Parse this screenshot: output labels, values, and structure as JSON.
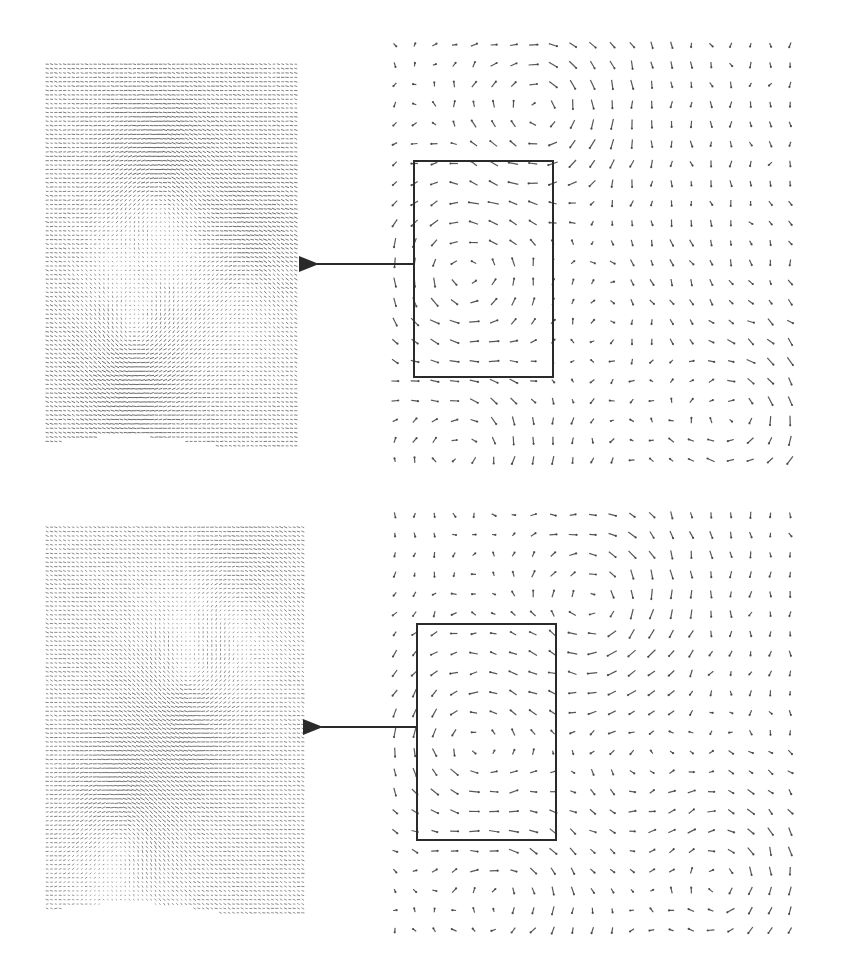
{
  "figure": {
    "width": 841,
    "height": 977,
    "background": "#ffffff",
    "ink_color": "#3a3a3a",
    "box_color": "#2a2a2a",
    "arrow_color": "#2a2a2a"
  },
  "chart_data": [
    {
      "type": "quiver",
      "title": "",
      "xlabel": "",
      "ylabel": "",
      "panel": "top-left-dense-field",
      "description": "Dense warped vector field (zoomed region rendering)",
      "bounds": {
        "x": 45,
        "y": 62,
        "w": 253,
        "h": 386
      },
      "grid": {
        "cols": 58,
        "rows": 88
      },
      "vortices": [
        {
          "cx": 0.45,
          "cy": 0.35,
          "strength": 1.0,
          "sign": 1
        },
        {
          "cx": 0.35,
          "cy": 0.72,
          "strength": 1.1,
          "sign": -1
        },
        {
          "cx": 0.8,
          "cy": 0.55,
          "strength": 0.7,
          "sign": 1
        }
      ],
      "base_flow": {
        "u": 1.0,
        "v": 0.15
      },
      "arrow_len": 3.2,
      "opacity": 0.75
    },
    {
      "type": "quiver",
      "title": "",
      "xlabel": "",
      "ylabel": "",
      "panel": "top-right-sparse-field",
      "description": "Sparse velocity vector field with highlighted sub-region",
      "bounds": {
        "x": 385,
        "y": 35,
        "w": 415,
        "h": 435
      },
      "grid": {
        "cols": 21,
        "rows": 22
      },
      "vortices": [
        {
          "cx": 0.78,
          "cy": 0.45,
          "strength": 0.0,
          "sign": 1
        },
        {
          "cx": 0.38,
          "cy": 0.18,
          "strength": 1.4,
          "sign": 1
        },
        {
          "cx": 0.18,
          "cy": 0.55,
          "strength": 1.3,
          "sign": -1
        },
        {
          "cx": 0.87,
          "cy": 0.88,
          "strength": 1.1,
          "sign": 1
        },
        {
          "cx": 0.2,
          "cy": 0.95,
          "strength": 1.0,
          "sign": 1
        },
        {
          "cx": 0.55,
          "cy": 0.65,
          "strength": 0.6,
          "sign": 1
        }
      ],
      "base_flow": {
        "u": 0.0,
        "v": 0.35
      },
      "arrow_len": 8,
      "opacity": 0.85,
      "highlight_box": {
        "x": 414,
        "y": 161,
        "w": 139,
        "h": 216
      },
      "callout_arrow": {
        "from_x": 414,
        "from_y": 264,
        "to_x": 309,
        "to_y": 264
      }
    },
    {
      "type": "quiver",
      "title": "",
      "xlabel": "",
      "ylabel": "",
      "panel": "bottom-left-dense-field",
      "description": "Dense warped vector field (zoomed region rendering)",
      "bounds": {
        "x": 45,
        "y": 525,
        "w": 260,
        "h": 390
      },
      "grid": {
        "cols": 60,
        "rows": 89
      },
      "vortices": [
        {
          "cx": 0.55,
          "cy": 0.4,
          "strength": 1.0,
          "sign": -1
        },
        {
          "cx": 0.3,
          "cy": 0.78,
          "strength": 1.0,
          "sign": 1
        },
        {
          "cx": 0.75,
          "cy": 0.2,
          "strength": 0.6,
          "sign": 1
        }
      ],
      "base_flow": {
        "u": 0.9,
        "v": 0.25
      },
      "arrow_len": 3.2,
      "opacity": 0.7
    },
    {
      "type": "quiver",
      "title": "",
      "xlabel": "",
      "ylabel": "",
      "panel": "bottom-right-sparse-field",
      "description": "Sparse velocity vector field with highlighted sub-region",
      "bounds": {
        "x": 385,
        "y": 505,
        "w": 415,
        "h": 435
      },
      "grid": {
        "cols": 21,
        "rows": 22
      },
      "vortices": [
        {
          "cx": 0.52,
          "cy": 0.22,
          "strength": 1.3,
          "sign": 1
        },
        {
          "cx": 0.2,
          "cy": 0.55,
          "strength": 1.2,
          "sign": -1
        },
        {
          "cx": 0.82,
          "cy": 0.85,
          "strength": 1.0,
          "sign": 1
        },
        {
          "cx": 0.3,
          "cy": 0.9,
          "strength": 0.8,
          "sign": 1
        },
        {
          "cx": 0.6,
          "cy": 0.6,
          "strength": 0.5,
          "sign": -1
        }
      ],
      "base_flow": {
        "u": 0.0,
        "v": 0.35
      },
      "arrow_len": 8,
      "opacity": 0.85,
      "highlight_box": {
        "x": 417,
        "y": 624,
        "w": 139,
        "h": 216
      },
      "callout_arrow": {
        "from_x": 417,
        "from_y": 727,
        "to_x": 313,
        "to_y": 727
      }
    }
  ]
}
